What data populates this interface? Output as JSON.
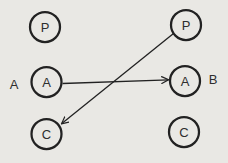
{
  "diagram": {
    "colors": {
      "background": "#e9e8e4",
      "line": "#222222",
      "label": "#2e2e2e"
    },
    "left_person": {
      "label": "A",
      "nodes": [
        {
          "label": "P"
        },
        {
          "label": "A"
        },
        {
          "label": "C"
        }
      ]
    },
    "right_person": {
      "label": "B",
      "nodes": [
        {
          "label": "P"
        },
        {
          "label": "A"
        },
        {
          "label": "C"
        }
      ]
    },
    "arrows": [
      {
        "from": "left A",
        "to": "right A"
      },
      {
        "from": "right P",
        "to": "left C"
      }
    ]
  }
}
